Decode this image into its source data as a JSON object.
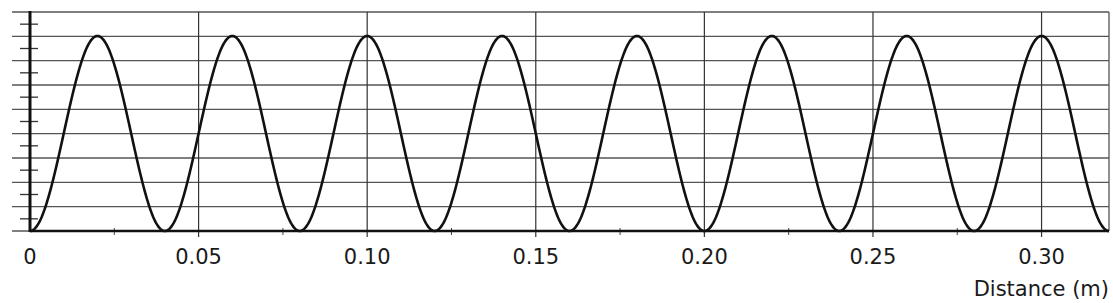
{
  "chart_data": {
    "type": "line",
    "title": "",
    "xlabel": "Distance (m)",
    "ylabel": "",
    "xlim": [
      0,
      0.32
    ],
    "ylim": [
      0,
      1
    ],
    "x_ticks": [
      0,
      0.05,
      0.1,
      0.15,
      0.2,
      0.25,
      0.3
    ],
    "x_tick_labels": [
      "0",
      "0.05",
      "0.10",
      "0.15",
      "0.20",
      "0.25",
      "0.30"
    ],
    "x_minor_tick_step": 0.025,
    "y_gridlines": 9,
    "y_minor_ticks_between_gridlines": true,
    "grid": true,
    "legend": null,
    "series": [
      {
        "name": "wave",
        "shape": "raised-cosine",
        "wavelength_m": 0.04,
        "peaks_x": [
          0.02,
          0.06,
          0.1,
          0.14,
          0.18,
          0.22,
          0.26,
          0.3
        ],
        "troughs_x": [
          0,
          0.04,
          0.08,
          0.12,
          0.16,
          0.2,
          0.24,
          0.28,
          0.32
        ],
        "peak_value": 1,
        "trough_value": 0,
        "x": [
          0,
          0.01,
          0.02,
          0.03,
          0.04,
          0.05,
          0.06,
          0.07,
          0.08,
          0.09,
          0.1,
          0.11,
          0.12,
          0.13,
          0.14,
          0.15,
          0.16,
          0.17,
          0.18,
          0.19,
          0.2,
          0.21,
          0.22,
          0.23,
          0.24,
          0.25,
          0.26,
          0.27,
          0.28,
          0.29,
          0.3,
          0.31,
          0.32
        ],
        "values": [
          0,
          0.5,
          1,
          0.5,
          0,
          0.5,
          1,
          0.5,
          0,
          0.5,
          1,
          0.5,
          0,
          0.5,
          1,
          0.5,
          0,
          0.5,
          1,
          0.5,
          0,
          0.5,
          1,
          0.5,
          0,
          0.5,
          1,
          0.5,
          0,
          0.5,
          1,
          0.5,
          0
        ]
      }
    ],
    "colors": {
      "line": "#111111",
      "grid": "#555555",
      "axis": "#111111"
    }
  }
}
